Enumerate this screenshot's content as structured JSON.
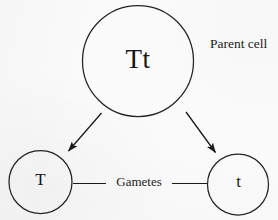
{
  "diagram": {
    "background_color": "#fbfbfb",
    "ink_color": "#1b1b1b",
    "parent_cell": {
      "genotype": "Tt",
      "caption": "Parent cell"
    },
    "connector_caption": "Gametes",
    "gametes": [
      {
        "allele": "T",
        "position": "left"
      },
      {
        "allele": "t",
        "position": "right"
      }
    ]
  }
}
